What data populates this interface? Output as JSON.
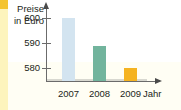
{
  "chart_data": {
    "type": "bar",
    "title": "",
    "subtitle": "",
    "xlabel": "Jahr",
    "ylabel": "Preise in Euro",
    "ylabel_lines": [
      "Preise",
      "in Euro"
    ],
    "categories": [
      "2007",
      "2008",
      "2009"
    ],
    "values": [
      600,
      589,
      580
    ],
    "ytick_labels": [
      "600",
      "590",
      "580"
    ],
    "ytick_values": [
      600,
      590,
      580
    ],
    "ylim": [
      575,
      604
    ],
    "grid": false,
    "legend": null,
    "legend_position": "none",
    "axis_arrows": true,
    "series": [
      {
        "name": "Preise in Euro",
        "values": [
          600,
          589,
          580
        ],
        "colors": [
          "#d3e4f0",
          "#72b49d",
          "#f5b321"
        ]
      }
    ],
    "bars": [
      {
        "category": "2007",
        "value": 600,
        "color": "#d3e4f0"
      },
      {
        "category": "2008",
        "value": 589,
        "color": "#72b49d"
      },
      {
        "category": "2009",
        "value": 580,
        "color": "#f5b321"
      }
    ],
    "annotations": []
  },
  "figure": {
    "background_color": "#ffffff",
    "tint_color": "#fffef4",
    "axis_color": "#6b6b6b",
    "text_color": "#231f20",
    "baseline_color": "#d8d8d0",
    "edge_stripe_color": "#fdf4bd",
    "edge_tab_color": "#f4c430"
  }
}
